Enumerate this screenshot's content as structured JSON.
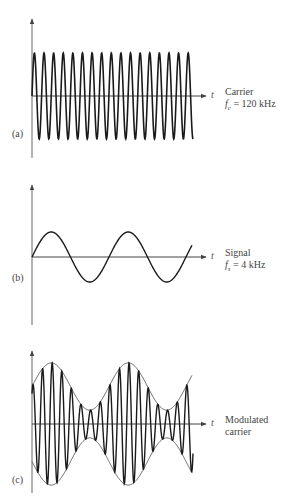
{
  "figure": {
    "panels": [
      {
        "id": "a",
        "tag": "(a)",
        "axis_label": "t",
        "title": "Carrier",
        "freq_symbol": "f",
        "freq_sub": "c",
        "freq_value": "= 120 kHz",
        "wave": "carrier",
        "cycles": 17
      },
      {
        "id": "b",
        "tag": "(b)",
        "axis_label": "t",
        "title": "Signal",
        "freq_symbol": "f",
        "freq_sub": "s",
        "freq_value": "= 4 kHz",
        "wave": "signal",
        "cycles": 2.1
      },
      {
        "id": "c",
        "tag": "(c)",
        "axis_label": "t",
        "title": "Modulated",
        "title_line2": "carrier",
        "wave": "am",
        "modulation_index": 0.63
      }
    ],
    "stroke_color": "#1a1a1a",
    "axis_color": "#555555",
    "envelope_color": "#444444"
  }
}
